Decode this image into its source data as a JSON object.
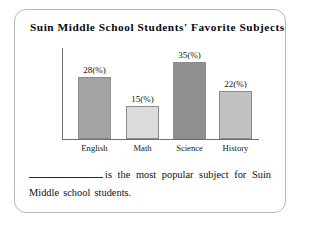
{
  "frame": {
    "border_color": "#b9b9b9"
  },
  "chart_data": {
    "type": "bar",
    "title": "Suin Middle School Students' Favorite Subjects",
    "categories": [
      "English",
      "Math",
      "Science",
      "History"
    ],
    "values": [
      28,
      15,
      35,
      22
    ],
    "value_labels": [
      "28(%)",
      "15(%)",
      "35(%)",
      "22(%)"
    ],
    "bar_colors": [
      "#a3a3a3",
      "#dcdcdc",
      "#8f8f8f",
      "#c2c2c2"
    ],
    "xlabel": "",
    "ylabel": "",
    "ylim": [
      0,
      40
    ],
    "grid": false,
    "legend": "none",
    "axis_color": "#6e6e6e"
  },
  "question": {
    "before_blank": "",
    "after_blank": "is the most popular subject for Suin Middle school students."
  }
}
